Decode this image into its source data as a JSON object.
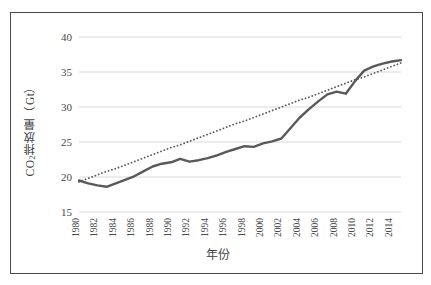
{
  "chart_data": {
    "type": "line",
    "title": "",
    "xlabel": "年份",
    "ylabel": "CO2排放量（Gt）",
    "ylabel_prefix": "CO",
    "ylabel_subscript": "2",
    "ylabel_suffix": "排放量（Gt）",
    "ylim": [
      15,
      40
    ],
    "yticks": [
      15,
      20,
      25,
      30,
      35,
      40
    ],
    "xlim": [
      1980,
      2015
    ],
    "xticks": [
      1980,
      1982,
      1984,
      1986,
      1988,
      1990,
      1992,
      1994,
      1996,
      1998,
      2000,
      2002,
      2004,
      2006,
      2008,
      2010,
      2012,
      2014
    ],
    "grid": "horizontal",
    "legend": "none",
    "x": [
      1980,
      1981,
      1982,
      1983,
      1984,
      1985,
      1986,
      1987,
      1988,
      1989,
      1990,
      1991,
      1992,
      1993,
      1994,
      1995,
      1996,
      1997,
      1998,
      1999,
      2000,
      2001,
      2002,
      2003,
      2004,
      2005,
      2006,
      2007,
      2008,
      2009,
      2010,
      2011,
      2012,
      2013,
      2014,
      2015
    ],
    "series": [
      {
        "name": "CO2排放量",
        "style": "solid",
        "color": "#595959",
        "values": [
          19.5,
          19.1,
          18.8,
          18.6,
          19.1,
          19.6,
          20.1,
          20.8,
          21.5,
          21.9,
          22.1,
          22.6,
          22.2,
          22.4,
          22.7,
          23.1,
          23.6,
          24.0,
          24.4,
          24.3,
          24.8,
          25.1,
          25.5,
          27.0,
          28.5,
          29.7,
          30.8,
          31.8,
          32.2,
          31.9,
          33.7,
          35.2,
          35.8,
          36.2,
          36.5,
          36.7
        ]
      },
      {
        "name": "线性趋势线",
        "style": "dotted",
        "color": "#595959",
        "values": [
          19.3,
          19.8,
          20.3,
          20.8,
          21.2,
          21.7,
          22.2,
          22.7,
          23.2,
          23.7,
          24.2,
          24.6,
          25.1,
          25.6,
          26.1,
          26.6,
          27.1,
          27.6,
          28.0,
          28.5,
          29.0,
          29.5,
          30.0,
          30.5,
          31.0,
          31.4,
          31.9,
          32.4,
          32.9,
          33.4,
          33.9,
          34.3,
          34.8,
          35.3,
          35.8,
          36.3
        ]
      }
    ],
    "colors": {
      "line": "#595959",
      "gridline": "#d9d9d9",
      "axis_text": "#4a4a4a",
      "frame": "#4a4a4a",
      "background": "#ffffff"
    }
  }
}
